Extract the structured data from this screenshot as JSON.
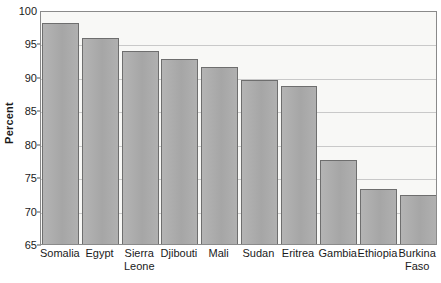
{
  "chart_data": {
    "type": "bar",
    "title": "",
    "xlabel": "",
    "ylabel": "Percent",
    "ylim": [
      65,
      100
    ],
    "ytick_values": [
      65,
      70,
      75,
      80,
      85,
      90,
      95,
      100
    ],
    "ytick_labels": [
      "65",
      "70",
      "75",
      "80",
      "85",
      "90",
      "95",
      "100"
    ],
    "grid": true,
    "legend": "none",
    "categories": [
      "Somalia",
      "Egypt",
      "Sierra Leone",
      "Djibouti",
      "Mali",
      "Sudan",
      "Eritrea",
      "Gambia",
      "Ethiopia",
      "Burkina Faso"
    ],
    "category_lines": [
      [
        "Somalia"
      ],
      [
        "Egypt"
      ],
      [
        "Sierra",
        "Leone"
      ],
      [
        "Djibouti"
      ],
      [
        "Mali"
      ],
      [
        "Sudan"
      ],
      [
        "Eritrea"
      ],
      [
        "Gambia"
      ],
      [
        "Ethiopia"
      ],
      [
        "Burkina",
        "Faso"
      ]
    ],
    "values": [
      98.0,
      95.8,
      93.8,
      92.7,
      91.5,
      89.6,
      88.6,
      77.5,
      73.3,
      72.3
    ],
    "colors": {
      "bar_fill": "#acacac",
      "bar_edge": "#6e6e6e",
      "plot_background": "#f8f8f6",
      "gridline": "#c9c9c9",
      "axis": "#8a8a8a",
      "text": "#1a1a1a"
    }
  }
}
